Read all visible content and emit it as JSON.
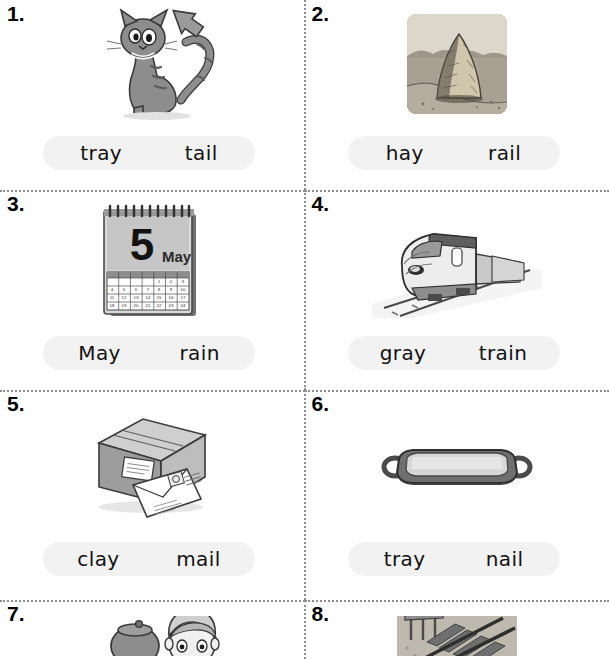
{
  "worksheet": {
    "title": "Phonics picture-word choice worksheet (ai / ay)",
    "columns": 2,
    "choice_box_color": "#f2f2f2",
    "divider_color": "#8d8d8d"
  },
  "items": [
    {
      "number": "1.",
      "picture": "cat-with-arrow-pointing-to-tail",
      "choices": [
        "tray",
        "tail"
      ]
    },
    {
      "number": "2.",
      "picture": "haystack-in-field-photo",
      "choices": [
        "hay",
        "rail"
      ]
    },
    {
      "number": "3.",
      "picture": "desk-calendar-5-may",
      "calendar_day": "5",
      "calendar_month": "May",
      "choices": [
        "May",
        "rain"
      ]
    },
    {
      "number": "4.",
      "picture": "high-speed-train-on-tracks",
      "choices": [
        "gray",
        "train"
      ]
    },
    {
      "number": "5.",
      "picture": "parcel-box-with-envelope",
      "choices": [
        "clay",
        "mail"
      ]
    },
    {
      "number": "6.",
      "picture": "serving-tray-with-handles",
      "choices": [
        "tray",
        "nail"
      ]
    },
    {
      "number": "7.",
      "picture": "boy-with-pot-cropped",
      "choices": []
    },
    {
      "number": "8.",
      "picture": "railway-track-cropped",
      "choices": []
    }
  ]
}
